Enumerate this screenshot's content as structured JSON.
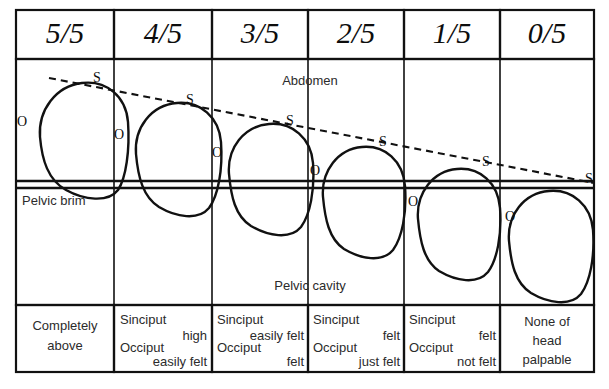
{
  "diagram": {
    "zones": {
      "abdomen_label": "Abdomen",
      "pelvic_brim_label": "Pelvic brim",
      "pelvic_cavity_label": "Pelvic cavity"
    },
    "marker_names": {
      "sinciput": "S",
      "occiput": "O"
    },
    "columns": [
      {
        "header": "5/5",
        "sinciput_marker": "S",
        "occiput_marker": "O",
        "findings": [
          "Completely",
          "above"
        ],
        "finding_style": "centered",
        "head_cx": 84,
        "head_cy": 140,
        "head_rx": 44,
        "head_ry": 58,
        "s_x": 97,
        "s_y": 79,
        "o_x": 22,
        "o_y": 123
      },
      {
        "header": "4/5",
        "sinciput_marker": "S",
        "occiput_marker": "O",
        "findings": [
          "Sinciput",
          "high",
          "Occiput",
          "easily felt"
        ],
        "finding_style": "staggered",
        "head_cx": 178,
        "head_cy": 157,
        "head_rx": 43,
        "head_ry": 56,
        "s_x": 190,
        "s_y": 101,
        "o_x": 117,
        "o_y": 136
      },
      {
        "header": "3/5",
        "sinciput_marker": "S",
        "occiput_marker": "O",
        "findings": [
          "Sinciput",
          "easily felt",
          "Occiput",
          "felt"
        ],
        "finding_style": "staggered",
        "head_cx": 270,
        "head_cy": 176,
        "head_rx": 42,
        "head_ry": 55,
        "s_x": 290,
        "s_y": 122,
        "o_x": 215,
        "o_y": 154
      },
      {
        "header": "2/5",
        "sinciput_marker": "S",
        "occiput_marker": "O",
        "findings": [
          "Sinciput",
          "felt",
          "Occiput",
          "just felt"
        ],
        "finding_style": "staggered",
        "head_cx": 363,
        "head_cy": 199,
        "head_rx": 41,
        "head_ry": 54,
        "s_x": 383,
        "s_y": 143,
        "o_x": 315,
        "o_y": 172
      },
      {
        "header": "1/5",
        "sinciput_marker": "S",
        "occiput_marker": "O",
        "findings": [
          "Sinciput",
          "felt",
          "Occiput",
          "not felt"
        ],
        "finding_style": "staggered",
        "head_cx": 458,
        "head_cy": 221,
        "head_rx": 41,
        "head_ry": 54,
        "s_x": 486,
        "s_y": 163,
        "o_x": 412,
        "o_y": 203
      },
      {
        "header": "0/5",
        "sinciput_marker": "S",
        "occiput_marker": "O",
        "findings": [
          "None of",
          "head",
          "palpable"
        ],
        "finding_style": "centered",
        "head_cx": 550,
        "head_cy": 243,
        "head_rx": 42,
        "head_ry": 55,
        "s_x": 589,
        "s_y": 181,
        "o_x": 509,
        "o_y": 218
      }
    ],
    "colors": {
      "ink": "#111111",
      "text": "#2b2b2b",
      "background": "#ffffff"
    }
  }
}
